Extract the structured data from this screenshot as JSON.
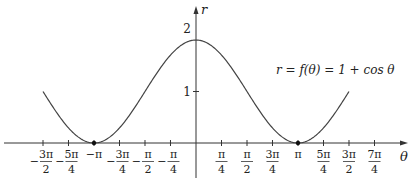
{
  "chart_data": {
    "type": "line",
    "title": "",
    "annotation": "r = f(θ) = 1 + cos θ",
    "xlabel": "θ",
    "ylabel": "r",
    "x_ticks": [
      {
        "value": -4.712,
        "num": "3π",
        "den": "2",
        "neg": true
      },
      {
        "value": -3.927,
        "num": "5π",
        "den": "4",
        "neg": true
      },
      {
        "value": -3.1416,
        "num": "π",
        "den": "",
        "neg": true
      },
      {
        "value": -2.356,
        "num": "3π",
        "den": "4",
        "neg": true
      },
      {
        "value": -1.5708,
        "num": "π",
        "den": "2",
        "neg": true
      },
      {
        "value": -0.7854,
        "num": "π",
        "den": "4",
        "neg": true
      },
      {
        "value": 0.7854,
        "num": "π",
        "den": "4",
        "neg": false
      },
      {
        "value": 1.5708,
        "num": "π",
        "den": "2",
        "neg": false
      },
      {
        "value": 2.356,
        "num": "3π",
        "den": "4",
        "neg": false
      },
      {
        "value": 3.1416,
        "num": "π",
        "den": "",
        "neg": false
      },
      {
        "value": 3.927,
        "num": "5π",
        "den": "4",
        "neg": false
      },
      {
        "value": 4.712,
        "num": "3π",
        "den": "2",
        "neg": false
      },
      {
        "value": 5.498,
        "num": "7π",
        "den": "4",
        "neg": false
      }
    ],
    "y_ticks": [
      {
        "value": 1,
        "label": "1"
      },
      {
        "value": 2,
        "label": "2"
      }
    ],
    "xlim": [
      -4.712,
      4.712
    ],
    "ylim": [
      0,
      2
    ],
    "series": [
      {
        "name": "r = 1 + cos θ",
        "function": "1 + cos(theta)",
        "domain": [
          -4.712,
          4.712
        ]
      }
    ],
    "points": [
      {
        "x": -3.1416,
        "y": 0
      },
      {
        "x": 3.1416,
        "y": 0
      }
    ],
    "grid": false
  }
}
